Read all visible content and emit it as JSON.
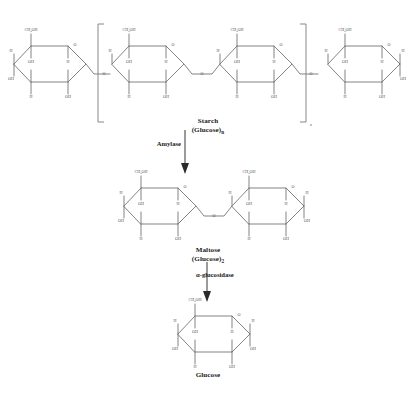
{
  "diagram": {
    "type": "reaction-pathway",
    "background_color": "#ffffff",
    "bond_color": "#6d6d6d",
    "text_color": "#1a1a1a"
  },
  "stages": [
    {
      "id": "starch",
      "name": "Starch",
      "formula_text": "(Glucose)",
      "formula_subscript": "n",
      "ring_count": 4,
      "bracketed": true,
      "bracket_subscript": "n"
    },
    {
      "id": "maltose",
      "name": "Maltose",
      "formula_text": "(Glucose)",
      "formula_subscript": "2",
      "ring_count": 2,
      "bracketed": false,
      "bracket_subscript": ""
    },
    {
      "id": "glucose",
      "name": "Glucose",
      "formula_text": "",
      "formula_subscript": "",
      "ring_count": 1,
      "bracketed": false,
      "bracket_subscript": ""
    }
  ],
  "enzymes": [
    {
      "id": "amylase",
      "label": "Amylase",
      "from": "starch",
      "to": "maltose"
    },
    {
      "id": "alpha-glucosidase",
      "label": "α-glucosidase",
      "from": "maltose",
      "to": "glucose"
    }
  ],
  "atom_labels": {
    "ring_oxygen": "O",
    "glycosidic_oxygen": "O",
    "hydroxyl": "OH",
    "hydrogen": "H",
    "hydroxymethyl_main": "CH",
    "hydroxymethyl_sub": "2",
    "hydroxymethyl_tail": "OH"
  },
  "captions": {
    "starch_name": "Starch",
    "starch_formula_open": "(Glucose)",
    "starch_formula_sub": "n",
    "maltose_name": "Maltose",
    "maltose_formula_open": "(Glucose)",
    "maltose_formula_sub": "2",
    "glucose_name": "Glucose"
  }
}
